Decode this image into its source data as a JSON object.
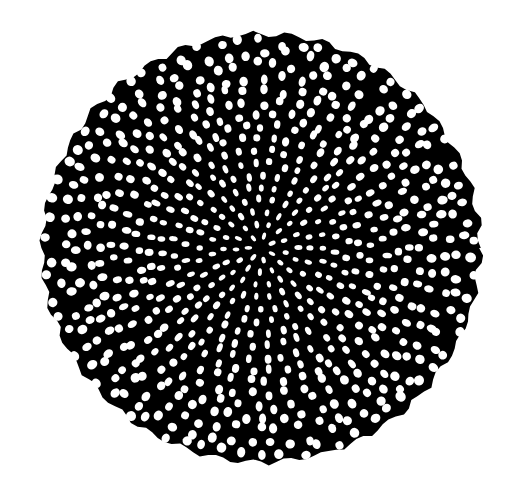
{
  "artwork": {
    "subject": "hand-drawn circular radial cell pattern (doily / mandala)",
    "canvas": {
      "width": 512,
      "height": 486
    },
    "background_color": "#ffffff",
    "ink_color": "#000000",
    "cell_color": "#ffffff",
    "disc": {
      "cx": 261,
      "cy": 248,
      "rx": 219,
      "ry": 214
    },
    "rings": 17,
    "center_cell_size": 5,
    "outer_cell_size": 9
  }
}
